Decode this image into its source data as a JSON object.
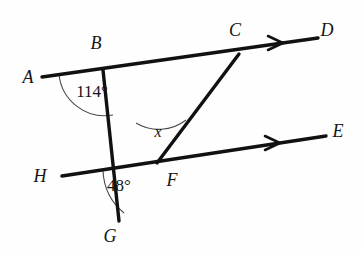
{
  "figure": {
    "background_color": "#fefefe",
    "line_color": "#111111",
    "arc_color": "#4a4a4a"
  },
  "points": {
    "A": {
      "label": "A",
      "x": 28,
      "y": 79
    },
    "B": {
      "label": "B",
      "x": 96,
      "y": 45
    },
    "C": {
      "label": "C",
      "x": 235,
      "y": 32
    },
    "D": {
      "label": "D",
      "x": 327,
      "y": 32
    },
    "E": {
      "label": "E",
      "x": 338,
      "y": 133
    },
    "F": {
      "label": "F",
      "x": 172,
      "y": 182
    },
    "G": {
      "label": "G",
      "x": 110,
      "y": 238
    },
    "H": {
      "label": "H",
      "x": 40,
      "y": 178
    }
  },
  "segments": {
    "AD": {
      "name": "line-AD",
      "x1": 42,
      "y1": 77,
      "x2": 318,
      "y2": 38
    },
    "HE": {
      "name": "line-HE",
      "x1": 62,
      "y1": 176,
      "x2": 326,
      "y2": 136
    },
    "BG": {
      "name": "line-BG",
      "x1": 103,
      "y1": 70,
      "x2": 119,
      "y2": 221
    },
    "CF": {
      "name": "line-CF",
      "x1": 239,
      "y1": 54,
      "x2": 157,
      "y2": 163
    }
  },
  "angles": {
    "at_B": {
      "label": "114°",
      "value": 114,
      "unit": "degrees",
      "x": 92,
      "y": 93
    },
    "at_F_top": {
      "label": "x",
      "value": "x",
      "unit": "unknown",
      "x": 158,
      "y": 133
    },
    "at_F_bottom": {
      "label": "48°",
      "value": 48,
      "unit": "degrees",
      "x": 119,
      "y": 187
    }
  },
  "arrow_markers": {
    "on_AD": {
      "name": "parallel-arrow-AD",
      "x": 277,
      "y": 43
    },
    "on_HE": {
      "name": "parallel-arrow-HE",
      "x": 274,
      "y": 143
    }
  }
}
